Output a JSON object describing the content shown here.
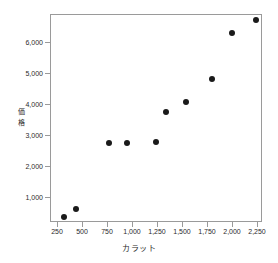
{
  "chart_data": {
    "type": "scatter",
    "title": "",
    "xlabel": "カラット",
    "ylabel": "価格",
    "grid": false,
    "legend": null,
    "xlim": [
      180,
      2300
    ],
    "ylim": [
      180,
      6900
    ],
    "xticks": [
      250,
      500,
      750,
      1000,
      1250,
      1500,
      1750,
      2000,
      2250
    ],
    "xtick_labels": [
      "250",
      "500",
      "750",
      "1,000",
      "1,250",
      "1,500",
      "1,750",
      "2,000",
      "2,250"
    ],
    "yticks": [
      1000,
      2000,
      3000,
      4000,
      5000,
      6000
    ],
    "ytick_labels": [
      "1,000",
      "2,000",
      "3,000",
      "4,000",
      "5,000",
      "6,000"
    ],
    "marker": "filled-circle",
    "marker_color": "#1a1a1a",
    "axis_color": "#9a9a9a",
    "background": "#ffffff",
    "points": [
      {
        "x": 310,
        "y": 380
      },
      {
        "x": 425,
        "y": 630
      },
      {
        "x": 760,
        "y": 2770
      },
      {
        "x": 935,
        "y": 2770
      },
      {
        "x": 1225,
        "y": 2800
      },
      {
        "x": 1330,
        "y": 3760
      },
      {
        "x": 1530,
        "y": 4100
      },
      {
        "x": 1785,
        "y": 4820
      },
      {
        "x": 1990,
        "y": 6320
      },
      {
        "x": 2225,
        "y": 6750
      }
    ]
  }
}
